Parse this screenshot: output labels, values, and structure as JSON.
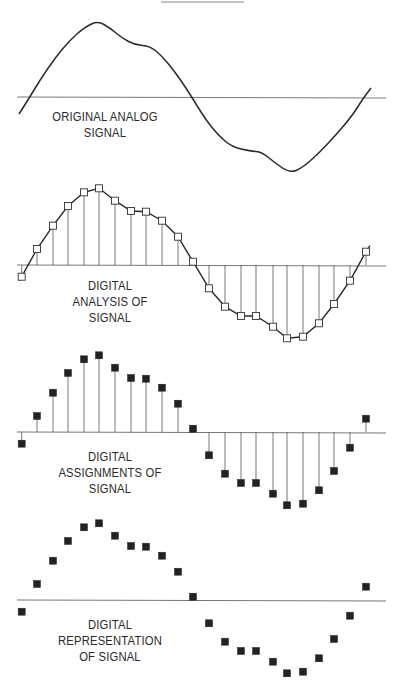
{
  "figure": {
    "top_rule": {
      "x1": 161,
      "x2": 244,
      "y": 2
    },
    "axis_x_start": 17,
    "axis_x_end": 386,
    "line_color": "#2a2a2a",
    "axis_color": "#777777"
  },
  "samples": {
    "x": [
      21.7,
      37,
      53,
      68,
      84,
      99,
      115,
      131,
      146,
      162,
      178,
      193,
      209,
      225,
      241,
      256,
      273,
      287,
      303,
      319,
      334,
      350,
      366
    ],
    "values": [
      -11.7,
      16,
      39.3,
      59,
      72.7,
      76.7,
      64.3,
      54,
      53.3,
      44.3,
      28.3,
      3.3,
      -23.3,
      -41.7,
      -51,
      -51,
      -61.7,
      -73.3,
      -71.7,
      -58.3,
      -39,
      -15.7,
      13.3
    ]
  },
  "panels": [
    {
      "id": "original-analog",
      "baseline_y": 97,
      "mode": "curve",
      "label_lines": [
        "ORIGINAL ANALOG",
        "SIGNAL"
      ],
      "label_x": 40,
      "label_y": 109,
      "label_w": 130
    },
    {
      "id": "digital-analysis",
      "baseline_y": 265,
      "mode": "open-squares-stems-line",
      "label_lines": [
        "DIGITAL",
        "ANALYSIS OF",
        "SIGNAL"
      ],
      "label_x": 55,
      "label_y": 278,
      "label_w": 110
    },
    {
      "id": "digital-assignments",
      "baseline_y": 432,
      "mode": "filled-squares-stems",
      "label_lines": [
        "DIGITAL",
        "ASSIGNMENTS OF",
        "SIGNAL"
      ],
      "label_x": 45,
      "label_y": 449,
      "label_w": 130
    },
    {
      "id": "digital-representation",
      "baseline_y": 600,
      "mode": "filled-squares",
      "label_lines": [
        "DIGITAL",
        "REPRESENTATION",
        "OF SIGNAL"
      ],
      "label_x": 45,
      "label_y": 617,
      "label_w": 130
    }
  ],
  "analog_curve": {
    "points": [
      [
        19,
        114
      ],
      [
        28,
        100
      ],
      [
        40,
        80
      ],
      [
        55,
        58
      ],
      [
        70,
        40
      ],
      [
        85,
        27
      ],
      [
        98,
        21
      ],
      [
        110,
        28
      ],
      [
        122,
        38
      ],
      [
        135,
        45
      ],
      [
        150,
        46
      ],
      [
        162,
        56
      ],
      [
        175,
        72
      ],
      [
        186,
        88
      ],
      [
        196,
        104
      ],
      [
        206,
        120
      ],
      [
        218,
        135
      ],
      [
        232,
        147
      ],
      [
        250,
        151
      ],
      [
        262,
        152
      ],
      [
        275,
        163
      ],
      [
        290,
        173
      ],
      [
        302,
        168
      ],
      [
        318,
        154
      ],
      [
        335,
        136
      ],
      [
        352,
        116
      ],
      [
        362,
        100
      ],
      [
        371,
        88
      ]
    ]
  },
  "chart_data": {
    "type": "line",
    "title": "",
    "panels": [
      "ORIGINAL ANALOG SIGNAL",
      "DIGITAL ANALYSIS OF SIGNAL",
      "DIGITAL ASSIGNMENTS OF SIGNAL",
      "DIGITAL REPRESENTATION OF SIGNAL"
    ],
    "x": [
      1,
      2,
      3,
      4,
      5,
      6,
      7,
      8,
      9,
      10,
      11,
      12,
      13,
      14,
      15,
      16,
      17,
      18,
      19,
      20,
      21,
      22,
      23
    ],
    "series": [
      {
        "name": "sampled amplitude (relative px)",
        "values": [
          -12,
          16,
          39,
          59,
          73,
          77,
          64,
          54,
          53,
          44,
          28,
          3,
          -23,
          -42,
          -51,
          -51,
          -62,
          -73,
          -72,
          -58,
          -39,
          -16,
          13
        ]
      }
    ],
    "xlabel": "",
    "ylabel": "",
    "grid": false
  }
}
